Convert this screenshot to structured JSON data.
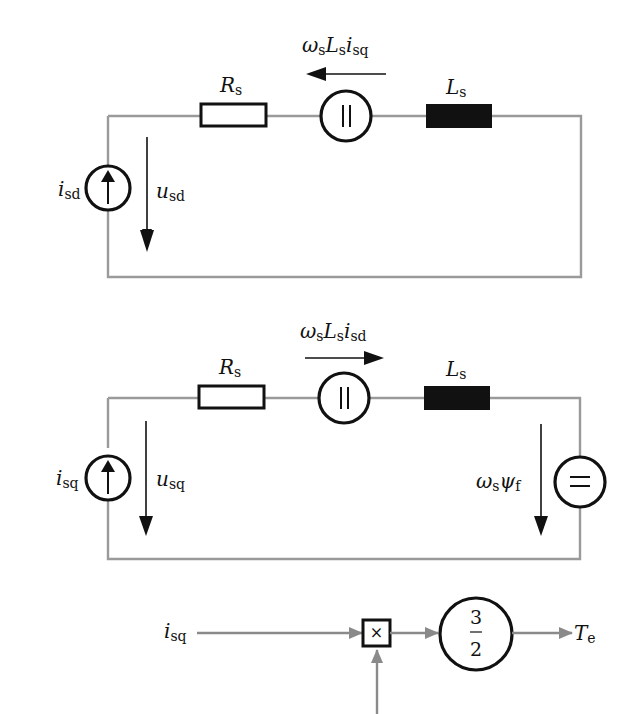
{
  "circuit_d_axis": {
    "current_source": {
      "symbol": "i",
      "subscript": "sd"
    },
    "voltage": {
      "symbol": "u",
      "subscript": "sd"
    },
    "resistor": {
      "symbol": "R",
      "subscript": "s"
    },
    "inductor": {
      "symbol": "L",
      "subscript": "s"
    },
    "coupling_source": {
      "label_parts": [
        {
          "symbol": "ω",
          "subscript": "s"
        },
        {
          "symbol": "L",
          "subscript": "s"
        },
        {
          "symbol": "i",
          "subscript": "sq"
        }
      ],
      "arrow_direction": "left",
      "glyph": "||"
    }
  },
  "circuit_q_axis": {
    "current_source": {
      "symbol": "i",
      "subscript": "sq"
    },
    "voltage": {
      "symbol": "u",
      "subscript": "sq"
    },
    "resistor": {
      "symbol": "R",
      "subscript": "s"
    },
    "inductor": {
      "symbol": "L",
      "subscript": "s"
    },
    "coupling_source": {
      "label_parts": [
        {
          "symbol": "ω",
          "subscript": "s"
        },
        {
          "symbol": "L",
          "subscript": "s"
        },
        {
          "symbol": "i",
          "subscript": "sd"
        }
      ],
      "arrow_direction": "right",
      "glyph": "||"
    },
    "back_emf": {
      "label_parts": [
        {
          "symbol": "ω",
          "subscript": "s"
        },
        {
          "symbol": "ψ",
          "subscript": "f"
        }
      ],
      "glyph": "="
    }
  },
  "torque_block": {
    "input": {
      "symbol": "i",
      "subscript": "sq"
    },
    "multiplier_glyph": "×",
    "gain": {
      "numerator": "3",
      "denominator": "2"
    },
    "output": {
      "symbol": "T",
      "subscript": "e"
    }
  }
}
